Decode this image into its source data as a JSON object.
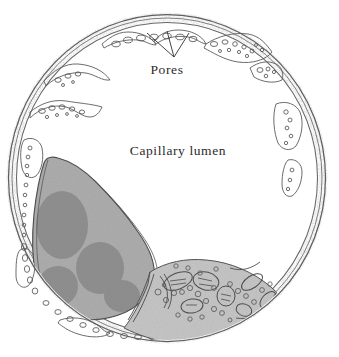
{
  "figure": {
    "background_color": "#ffffff",
    "ink_color": "#4a4a4a",
    "label_color": "#2b2b2b"
  },
  "labels": {
    "pores": "Pores",
    "capillary_lumen": "Capillary lumen"
  },
  "leaders": {
    "pores_arrow_count": 3,
    "pores_converge_point": [
      174,
      57
    ]
  },
  "structures": {
    "outer_wall": {
      "name": "endothelial-wall",
      "shape": "circle",
      "center": [
        167,
        178
      ],
      "radius_x": 158,
      "radius_y": 163,
      "stroke_color": "#555555"
    },
    "lumen": {
      "name": "capillary-lumen",
      "fill": "#ffffff"
    },
    "nucleus": {
      "name": "endothelial-nucleus",
      "fill": "#9a9a9a",
      "texture": "stipple",
      "position": "lower-left"
    },
    "cytoplasm": {
      "name": "endothelial-cytoplasm",
      "fill": "#b8b8b8",
      "position": "lower-right",
      "contents": [
        "vesicles",
        "mitochondria",
        "golgi"
      ]
    },
    "vesicles": {
      "name": "pinocytotic-vesicles",
      "stroke_color": "#5a5a5a"
    }
  }
}
